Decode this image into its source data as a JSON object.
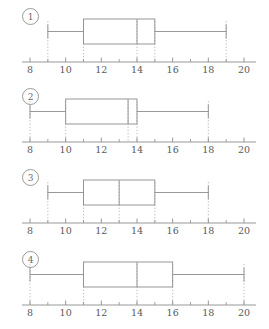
{
  "figure": {
    "title": "",
    "panel_count": 4,
    "colors": {
      "box_stroke": "#8d8d8d",
      "whisker_stroke": "#8d8d8d",
      "median_stroke": "#8d8d8d",
      "guide_dotted": "#b9b9b9",
      "axis_stroke": "#8d8d8d",
      "tick_label": "#58585a",
      "label_circle": "#9a9a9a"
    }
  },
  "chart_data": {
    "type": "box",
    "title": "",
    "xlabel": "",
    "ylabel": "",
    "xlim": [
      7.2,
      20.8
    ],
    "xticks": [
      8,
      10,
      12,
      14,
      16,
      18,
      20
    ],
    "xticklabels": [
      "8",
      "10",
      "12",
      "14",
      "16",
      "18",
      "20"
    ],
    "minor_ticks": [
      9,
      11,
      13,
      15,
      17,
      19
    ],
    "grid": false,
    "legend": "none",
    "orientation": "horizontal",
    "guides": "dotted vertical droplines from each five-number-summary value down to the axis",
    "boxes": [
      {
        "label": "1",
        "min": 9,
        "q1": 11,
        "median": 14,
        "q3": 15,
        "max": 19,
        "iqr": 4,
        "range": 10
      },
      {
        "label": "2",
        "min": 8,
        "q1": 10,
        "median": 13.5,
        "q3": 14,
        "max": 18,
        "iqr": 4,
        "range": 10
      },
      {
        "label": "3",
        "min": 9,
        "q1": 11,
        "median": 13,
        "q3": 15,
        "max": 18,
        "iqr": 4,
        "range": 9
      },
      {
        "label": "4",
        "min": 8,
        "q1": 11,
        "median": 14,
        "q3": 16,
        "max": 20,
        "iqr": 5,
        "range": 12
      }
    ]
  }
}
